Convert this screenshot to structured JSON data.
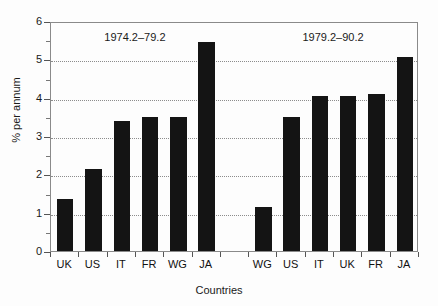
{
  "chart_data": {
    "type": "bar",
    "title": "",
    "xlabel": "Countries",
    "ylabel": "% per annum",
    "ylim": [
      0,
      6
    ],
    "ytick_values": [
      0,
      1,
      2,
      3,
      4,
      5,
      6
    ],
    "ytick_labels": [
      "0",
      "1",
      "2",
      "3",
      "4",
      "5",
      "6"
    ],
    "yminor_values": [
      0.5,
      1.5,
      2.5,
      3.5,
      4.5,
      5.5
    ],
    "grid": "horizontal dotted gridlines at 1,2,3,4,5",
    "gridline_values": [
      1,
      2,
      3,
      4,
      5
    ],
    "legend": "none",
    "legend_position": "none",
    "annotations": [
      {
        "text": "1974.2–79.2",
        "slot_center": 2.5
      },
      {
        "text": "1979.2–90.2",
        "slot_center": 9.5
      }
    ],
    "slots": [
      {
        "label": "UK",
        "value": 1.35,
        "group": "1974.2–79.2"
      },
      {
        "label": "US",
        "value": 2.15,
        "group": "1974.2–79.2"
      },
      {
        "label": "IT",
        "value": 3.4,
        "group": "1974.2–79.2"
      },
      {
        "label": "FR",
        "value": 3.5,
        "group": "1974.2–79.2"
      },
      {
        "label": "WG",
        "value": 3.5,
        "group": "1974.2–79.2"
      },
      {
        "label": "JA",
        "value": 5.45,
        "group": "1974.2–79.2"
      },
      {
        "label": "",
        "value": null,
        "group": ""
      },
      {
        "label": "WG",
        "value": 1.15,
        "group": "1979.2–90.2"
      },
      {
        "label": "US",
        "value": 3.5,
        "group": "1979.2–90.2"
      },
      {
        "label": "IT",
        "value": 4.05,
        "group": "1979.2–90.2"
      },
      {
        "label": "UK",
        "value": 4.05,
        "group": "1979.2–90.2"
      },
      {
        "label": "FR",
        "value": 4.1,
        "group": "1979.2–90.2"
      },
      {
        "label": "JA",
        "value": 5.05,
        "group": "1979.2–90.2"
      }
    ],
    "series": [
      {
        "name": "1974.2–79.2",
        "categories": [
          "UK",
          "US",
          "IT",
          "FR",
          "WG",
          "JA"
        ],
        "values": [
          1.35,
          2.15,
          3.4,
          3.5,
          3.5,
          5.45
        ]
      },
      {
        "name": "1979.2–90.2",
        "categories": [
          "WG",
          "US",
          "IT",
          "UK",
          "FR",
          "JA"
        ],
        "values": [
          1.15,
          3.5,
          4.05,
          4.05,
          4.1,
          5.05
        ]
      }
    ],
    "colors": {
      "bar": "#141414",
      "frame": "#8a8a8a",
      "gridline": "#8c8c8c",
      "text": "#111111",
      "background": "#fdfdfd"
    }
  }
}
